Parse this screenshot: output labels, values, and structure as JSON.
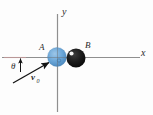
{
  "figure": {
    "kind": "physics-collision-diagram",
    "background_color": "#fdfdfd",
    "axis_color": "#8c8c8c",
    "vector_color": "#1a1a1a",
    "labels": {
      "y_axis": "y",
      "x_axis": "x",
      "ball_a": "A",
      "ball_b": "B",
      "angle": "θ",
      "velocity": "v",
      "velocity_subscript": "0"
    },
    "objects": {
      "ball_a": {
        "name": "A",
        "color": "#5b9bd5",
        "center_x": 57,
        "center_y": 57,
        "radius": 9.5
      },
      "ball_b": {
        "name": "B",
        "color": "#151515",
        "highlight_color": "#f2f2f2",
        "center_x": 76,
        "center_y": 58,
        "radius": 9.5
      }
    },
    "axes": {
      "origin_x": 57,
      "origin_y": 57,
      "x_min": 2,
      "x_max": 140,
      "y_min": 14,
      "y_max": 112
    },
    "vector": {
      "name": "v0",
      "tail_x": 13,
      "tail_y": 83,
      "head_x": 50,
      "head_y": 62,
      "angle_degrees": 30
    }
  }
}
